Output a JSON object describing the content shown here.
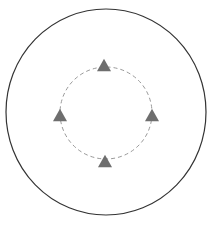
{
  "diagram": {
    "outer_circle": {
      "cx": 106,
      "cy": 112,
      "rx": 100,
      "ry": 103,
      "stroke": "#333333",
      "stroke_width": 1.2
    },
    "inner_circle": {
      "cx": 106,
      "cy": 113,
      "r": 46,
      "stroke": "#999999",
      "dash": "4 3"
    },
    "markers": {
      "color": "#6e6e6e",
      "shape": "triangle-up",
      "size": 14,
      "positions": [
        {
          "name": "top",
          "x": 104,
          "y": 65
        },
        {
          "name": "left",
          "x": 60,
          "y": 115
        },
        {
          "name": "right",
          "x": 152,
          "y": 115
        },
        {
          "name": "bottom",
          "x": 105,
          "y": 161
        }
      ]
    }
  }
}
